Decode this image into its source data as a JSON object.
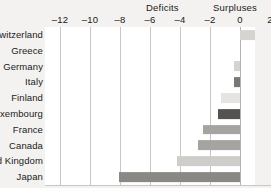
{
  "chart_data": {
    "type": "bar",
    "orientation": "horizontal",
    "title": "",
    "subtitle": "",
    "xlabel": "",
    "ylabel": "",
    "xlim": [
      -13,
      2
    ],
    "axis_ticks": [
      -12,
      -10,
      -8,
      -6,
      -4,
      -2,
      0,
      2
    ],
    "tick_labels": [
      "–12",
      "–10",
      "–8",
      "–6",
      "–4",
      "–2",
      "0",
      "2"
    ],
    "grid": true,
    "legend": "none",
    "zero_line": 0,
    "region_labels": {
      "negative": "Deficits",
      "positive": "Surpluses"
    },
    "categories": [
      "Switzerland",
      "Greece",
      "Germany",
      "Italy",
      "Finland",
      "Luxembourg",
      "France",
      "Canada",
      "United Kingdom",
      "Japan"
    ],
    "values": [
      1.3,
      0.0,
      -0.4,
      -0.4,
      -1.3,
      -1.5,
      -2.5,
      -2.8,
      -4.2,
      -8.1
    ],
    "bar_colors": [
      "#d6d4d1",
      "#d6d4d1",
      "#d6d4d1",
      "#7a7874",
      "#e6e4e1",
      "#555350",
      "#a6a4a0",
      "#a6a4a0",
      "#cfcdca",
      "#8a8884"
    ],
    "colors": {
      "plot_background": "#ffffff",
      "page_background": "#f3f2f0",
      "gridline": "#c9c7c4",
      "text": "#1a1a1a"
    }
  }
}
